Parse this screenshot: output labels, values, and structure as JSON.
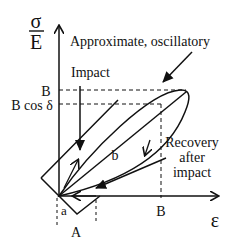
{
  "diagram": {
    "y_axis_label_top": "σ",
    "y_axis_label_bottom": "E",
    "x_axis_label": "ε",
    "annotations": {
      "oscillatory": "Approximate, oscillatory",
      "impact": "Impact",
      "recovery_line1": "Recovery",
      "recovery_line2": "after",
      "recovery_line3": "impact",
      "loop_label": "b",
      "rect_label_small": "a",
      "rect_label_big": "A"
    },
    "y_ticks": [
      "B",
      "B cos δ"
    ],
    "x_ticks": [
      "B"
    ],
    "colors": {
      "ink": "#111111",
      "background": "#ffffff"
    }
  }
}
